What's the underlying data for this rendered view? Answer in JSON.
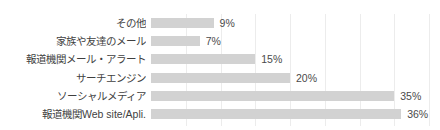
{
  "chart_data": {
    "type": "bar",
    "orientation": "horizontal",
    "title": "",
    "xlabel": "",
    "ylabel": "",
    "xlim": [
      0,
      41
    ],
    "grid": true,
    "grid_step": 5,
    "legend": "none",
    "value_suffix": "%",
    "bar_color": "#d2d2d2",
    "gridline_color": "#ececec",
    "label_color": "#3f3f3f",
    "value_color": "#4a4a4a",
    "categories": [
      "その他",
      "家族や友達のメール",
      "報道機関メール・アラート",
      "サーチエンジン",
      "ソーシャルメディア",
      "報道機関Web site/Apli."
    ],
    "values": [
      9,
      7,
      15,
      20,
      35,
      36
    ],
    "value_labels": [
      "9%",
      "7%",
      "15%",
      "20%",
      "35%",
      "36%"
    ],
    "gridline_positions": [
      5,
      10,
      15,
      20,
      25,
      30,
      35,
      40
    ]
  }
}
